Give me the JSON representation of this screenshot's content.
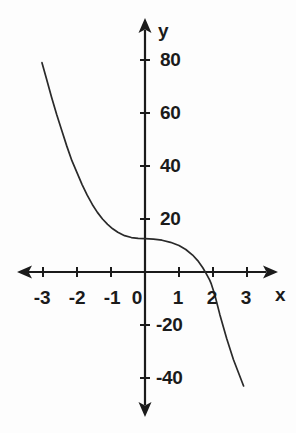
{
  "figure": {
    "background_color": "#fdfdfd",
    "ink_color": "#1b1b1b",
    "curve_color": "#2a2a2a"
  },
  "axes": {
    "x_axis_name": "x",
    "y_axis_name": "y",
    "x_ticks": [
      {
        "value": -3,
        "label": "-3",
        "px": 42
      },
      {
        "value": -2,
        "label": "-2",
        "px": 76
      },
      {
        "value": -1,
        "label": "-1",
        "px": 110
      },
      {
        "value": 0,
        "label": "0",
        "px": 144
      },
      {
        "value": 1,
        "label": "1",
        "px": 178
      },
      {
        "value": 2,
        "label": "2",
        "px": 212
      },
      {
        "value": 3,
        "label": "3",
        "px": 246
      }
    ],
    "y_ticks": [
      {
        "value": 80,
        "label": "80",
        "px": 60
      },
      {
        "value": 60,
        "label": "60",
        "px": 113
      },
      {
        "value": 40,
        "label": "40",
        "px": 166
      },
      {
        "value": 20,
        "label": "20",
        "px": 219
      },
      {
        "value": -20,
        "label": "-20",
        "px": 325
      },
      {
        "value": -40,
        "label": "-40",
        "px": 378
      }
    ]
  },
  "chart_data": {
    "type": "line",
    "title": "",
    "subtitle": "",
    "xlabel": "x",
    "ylabel": "y",
    "xlim": [
      -3.2,
      3.2
    ],
    "ylim": [
      -46,
      84
    ],
    "grid": false,
    "legend": null,
    "x_tick_labels": [
      "-3",
      "-2",
      "-1",
      "0",
      "1",
      "2",
      "3"
    ],
    "x_tick_values": [
      -3,
      -2,
      -1,
      0,
      1,
      2,
      3
    ],
    "y_tick_labels": [
      "80",
      "60",
      "40",
      "20",
      "-20",
      "-40"
    ],
    "y_tick_values": [
      80,
      60,
      40,
      20,
      -20,
      -40
    ],
    "axis_origin": {
      "x": 0,
      "y": 0
    },
    "series": [
      {
        "name": "curve",
        "style": "solid",
        "color": "#2a2a2a",
        "x": [
          -3.03,
          -2.9,
          -2.75,
          -2.6,
          -2.45,
          -2.3,
          -2.15,
          -2.0,
          -1.85,
          -1.7,
          -1.55,
          -1.4,
          -1.25,
          -1.1,
          -0.95,
          -0.8,
          -0.6,
          -0.4,
          -0.2,
          0.0,
          0.25,
          0.5,
          0.75,
          1.0,
          1.2,
          1.4,
          1.55,
          1.7,
          1.8,
          1.9,
          1.95,
          2.05,
          2.2,
          2.4,
          2.6,
          2.9
        ],
        "y": [
          79.0,
          73.0,
          66.0,
          59.5,
          53.5,
          47.5,
          42.0,
          37.5,
          33.0,
          29.0,
          25.5,
          22.5,
          20.0,
          18.0,
          16.3,
          15.0,
          13.7,
          13.0,
          12.7,
          12.6,
          12.4,
          12.0,
          11.2,
          10.0,
          8.5,
          6.4,
          4.3,
          1.6,
          -0.6,
          -3.0,
          -4.5,
          -8.5,
          -16.0,
          -25.0,
          -33.0,
          -43.0
        ]
      }
    ]
  }
}
